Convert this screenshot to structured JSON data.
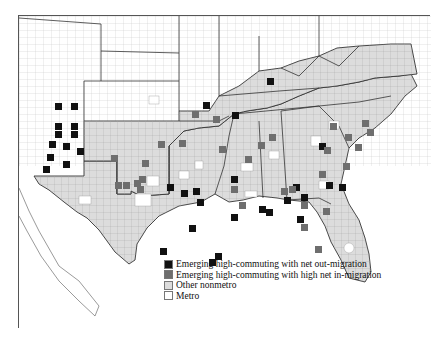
{
  "map": {
    "title": "",
    "region": "Southern United States counties",
    "colors": {
      "out_migration": "#111111",
      "in_migration": "#6e6e6e",
      "other_nonmetro": "#dcdcdc",
      "metro": "#ffffff",
      "outside": "#ffffff",
      "boundary": "#333333",
      "county_line": "#9a9a9a"
    }
  },
  "legend": {
    "items": [
      {
        "key": "out_migration",
        "label": "Emerging high-commuting with net out-migration"
      },
      {
        "key": "in_migration",
        "label": "Emerging high-commuting with high net in-migration"
      },
      {
        "key": "other_nonmetro",
        "label": "Other nonmetro"
      },
      {
        "key": "metro",
        "label": "Metro"
      }
    ]
  },
  "states_in_view": [
    "Colorado",
    "Kansas",
    "Missouri",
    "Illinois",
    "Indiana",
    "Ohio",
    "Pennsylvania",
    "Maryland",
    "Delaware",
    "New Mexico",
    "Oklahoma",
    "Texas",
    "Arkansas",
    "Louisiana",
    "Mississippi",
    "Alabama",
    "Tennessee",
    "Kentucky",
    "West Virginia",
    "Virginia",
    "North Carolina",
    "South Carolina",
    "Georgia",
    "Florida",
    "Mexico"
  ]
}
